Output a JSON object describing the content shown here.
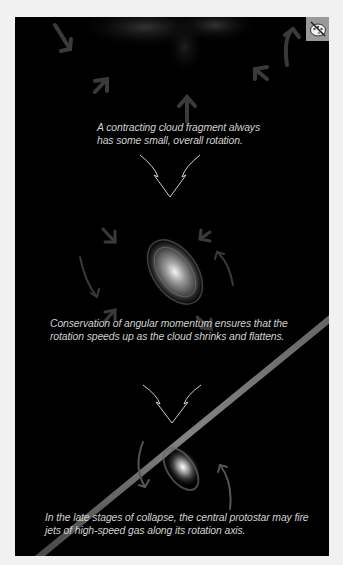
{
  "figure": {
    "stages": [
      {
        "caption": "A contracting cloud fragment always has some small, overall rotation."
      },
      {
        "caption": "Conservation of angular momentum ensures that the rotation speeds up as the cloud shrinks and flattens."
      },
      {
        "caption": "In the late stages of collapse, the central protostar may fire jets of high-speed gas along its rotation axis."
      }
    ],
    "toggle_icon": "palette-slash-icon",
    "colors": {
      "background": "#000000",
      "page": "#f1f1f1",
      "caption_text": "#d0d0d0",
      "arrow": "#3a3a3a",
      "icon_bg": "#9a9a9a"
    }
  }
}
